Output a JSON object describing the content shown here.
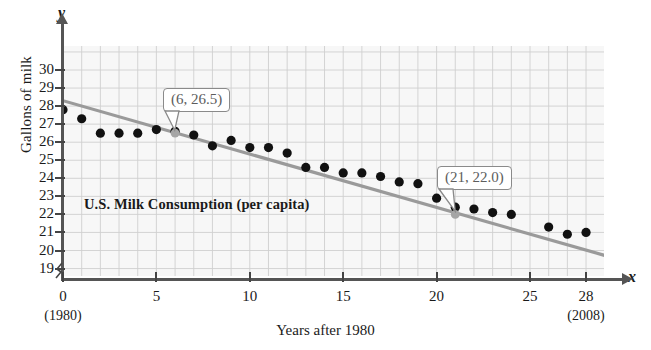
{
  "chart_data": {
    "type": "scatter",
    "title": "U.S. Milk Consumption (per capita)",
    "xlabel": "Years after 1980",
    "ylabel": "Gallons of milk",
    "x_axis_name": "x",
    "y_axis_name": "y",
    "xlim": [
      0,
      30
    ],
    "ylim": [
      19,
      30.5
    ],
    "grid": true,
    "x_ticks": [
      {
        "value": 0,
        "label": "0",
        "sublabel": "(1980)"
      },
      {
        "value": 5,
        "label": "5",
        "sublabel": ""
      },
      {
        "value": 10,
        "label": "10",
        "sublabel": ""
      },
      {
        "value": 15,
        "label": "15",
        "sublabel": ""
      },
      {
        "value": 20,
        "label": "20",
        "sublabel": ""
      },
      {
        "value": 25,
        "label": "25",
        "sublabel": ""
      },
      {
        "value": 28,
        "label": "28",
        "sublabel": "(2008)"
      }
    ],
    "y_ticks": [
      {
        "value": 30,
        "label": "30"
      },
      {
        "value": 29,
        "label": "29"
      },
      {
        "value": 28,
        "label": "28"
      },
      {
        "value": 27,
        "label": "27"
      },
      {
        "value": 26,
        "label": "26"
      },
      {
        "value": 25,
        "label": "25"
      },
      {
        "value": 24,
        "label": "24"
      },
      {
        "value": 23,
        "label": "23"
      },
      {
        "value": 22,
        "label": "22"
      },
      {
        "value": 21,
        "label": "21"
      },
      {
        "value": 20,
        "label": "20"
      },
      {
        "value": 19,
        "label": "19"
      }
    ],
    "axis_break": true,
    "points": [
      {
        "x": 0,
        "y": 27.8
      },
      {
        "x": 1,
        "y": 27.3
      },
      {
        "x": 2,
        "y": 26.5
      },
      {
        "x": 3,
        "y": 26.5
      },
      {
        "x": 4,
        "y": 26.5
      },
      {
        "x": 5,
        "y": 26.7
      },
      {
        "x": 6,
        "y": 26.6
      },
      {
        "x": 7,
        "y": 26.4
      },
      {
        "x": 8,
        "y": 25.8
      },
      {
        "x": 9,
        "y": 26.1
      },
      {
        "x": 10,
        "y": 25.7
      },
      {
        "x": 11,
        "y": 25.7
      },
      {
        "x": 12,
        "y": 25.4
      },
      {
        "x": 13,
        "y": 24.6
      },
      {
        "x": 14,
        "y": 24.6
      },
      {
        "x": 15,
        "y": 24.3
      },
      {
        "x": 16,
        "y": 24.3
      },
      {
        "x": 17,
        "y": 24.1
      },
      {
        "x": 18,
        "y": 23.8
      },
      {
        "x": 19,
        "y": 23.7
      },
      {
        "x": 20,
        "y": 22.9
      },
      {
        "x": 21,
        "y": 22.4
      },
      {
        "x": 22,
        "y": 22.3
      },
      {
        "x": 23,
        "y": 22.1
      },
      {
        "x": 24,
        "y": 22.0
      },
      {
        "x": 26,
        "y": 21.3
      },
      {
        "x": 27,
        "y": 20.9
      },
      {
        "x": 28,
        "y": 21.0
      }
    ],
    "trend_line": {
      "label": "regression line",
      "color": "#9a9a9a",
      "from": {
        "x": 0,
        "y": 28.3
      },
      "to": {
        "x": 29.6,
        "y": 19.55
      },
      "annotated_points": [
        {
          "x": 6,
          "y": 26.5,
          "label": "(6, 26.5)"
        },
        {
          "x": 21,
          "y": 22.0,
          "label": "(21, 22.0)"
        }
      ]
    },
    "colors": {
      "plot_background": "#f7f7f7",
      "grid": "#cfcfcf",
      "point": "#111111",
      "trend": "#9a9a9a",
      "axis": "#555555",
      "callout_text": "#5d5d5d",
      "callout_border": "#8a8a8a"
    }
  }
}
